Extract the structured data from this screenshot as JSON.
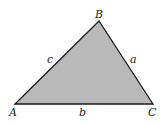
{
  "diagram": {
    "type": "triangle",
    "fill_color": "#b9b9b9",
    "stroke_color": "#1a1a1a",
    "vertices": [
      {
        "name": "A",
        "x": 15,
        "y": 104
      },
      {
        "name": "B",
        "x": 99,
        "y": 21
      },
      {
        "name": "C",
        "x": 153,
        "y": 104
      }
    ],
    "vertex_labels": {
      "A": "A",
      "B": "B",
      "C": "C"
    },
    "side_labels": {
      "a": "a",
      "b": "b",
      "c": "c"
    }
  }
}
